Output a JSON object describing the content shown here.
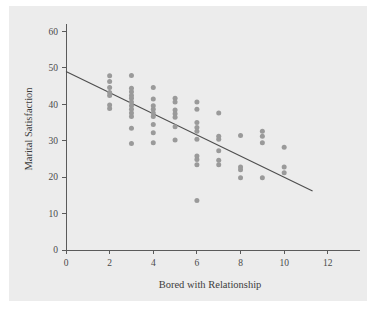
{
  "figure": {
    "background_color": "#ececec",
    "page_color": "#ffffff",
    "point_color": "#9a9a9a",
    "line_color": "#4e4e4e",
    "axis_color": "#5a5a5a"
  },
  "chart_data": {
    "type": "scatter",
    "title": "",
    "xlabel": "Bored with Relationship",
    "ylabel": "Marital Satisfaction",
    "xlim": [
      0,
      13.2
    ],
    "ylim": [
      0,
      62
    ],
    "xticks": [
      0,
      2,
      4,
      6,
      8,
      10,
      12
    ],
    "xticklabels": [
      "0",
      "2",
      "4",
      "6",
      "8",
      "10",
      "12"
    ],
    "yticks": [
      0,
      10,
      20,
      30,
      40,
      50,
      60
    ],
    "yticklabels": [
      "0",
      "10",
      "20",
      "30",
      "40",
      "50",
      "60"
    ],
    "grid": false,
    "legend": "none",
    "points": [
      {
        "x": 2,
        "y": 47.8
      },
      {
        "x": 2,
        "y": 46.2
      },
      {
        "x": 2,
        "y": 44.6
      },
      {
        "x": 2,
        "y": 43.2
      },
      {
        "x": 2,
        "y": 42.4
      },
      {
        "x": 2,
        "y": 39.8
      },
      {
        "x": 2,
        "y": 38.8
      },
      {
        "x": 3,
        "y": 47.9
      },
      {
        "x": 3,
        "y": 44.4
      },
      {
        "x": 3,
        "y": 43.4
      },
      {
        "x": 3,
        "y": 42.4
      },
      {
        "x": 3,
        "y": 41.6
      },
      {
        "x": 3,
        "y": 40.6
      },
      {
        "x": 3,
        "y": 39.6
      },
      {
        "x": 3,
        "y": 38.6
      },
      {
        "x": 3,
        "y": 37.6
      },
      {
        "x": 3,
        "y": 36.6
      },
      {
        "x": 3,
        "y": 33.4
      },
      {
        "x": 3,
        "y": 29.2
      },
      {
        "x": 4,
        "y": 44.6
      },
      {
        "x": 4,
        "y": 41.4
      },
      {
        "x": 4,
        "y": 39.6
      },
      {
        "x": 4,
        "y": 38.6
      },
      {
        "x": 4,
        "y": 37.6
      },
      {
        "x": 4,
        "y": 36.6
      },
      {
        "x": 4,
        "y": 34.4
      },
      {
        "x": 4,
        "y": 32.2
      },
      {
        "x": 4,
        "y": 29.4
      },
      {
        "x": 5,
        "y": 41.6
      },
      {
        "x": 5,
        "y": 40.6
      },
      {
        "x": 5,
        "y": 38.4
      },
      {
        "x": 5,
        "y": 37.4
      },
      {
        "x": 5,
        "y": 36.4
      },
      {
        "x": 5,
        "y": 33.8
      },
      {
        "x": 5,
        "y": 30.2
      },
      {
        "x": 6,
        "y": 40.6
      },
      {
        "x": 6,
        "y": 38.6
      },
      {
        "x": 6,
        "y": 35.0
      },
      {
        "x": 6,
        "y": 33.6
      },
      {
        "x": 6,
        "y": 32.6
      },
      {
        "x": 6,
        "y": 30.4
      },
      {
        "x": 6,
        "y": 25.8
      },
      {
        "x": 6,
        "y": 24.8
      },
      {
        "x": 6,
        "y": 23.4
      },
      {
        "x": 6,
        "y": 13.6
      },
      {
        "x": 7,
        "y": 37.6
      },
      {
        "x": 7,
        "y": 31.2
      },
      {
        "x": 7,
        "y": 30.4
      },
      {
        "x": 7,
        "y": 27.2
      },
      {
        "x": 7,
        "y": 24.6
      },
      {
        "x": 7,
        "y": 23.4
      },
      {
        "x": 8,
        "y": 31.4
      },
      {
        "x": 8,
        "y": 22.8
      },
      {
        "x": 8,
        "y": 22.0
      },
      {
        "x": 8,
        "y": 19.8
      },
      {
        "x": 9,
        "y": 32.6
      },
      {
        "x": 9,
        "y": 31.2
      },
      {
        "x": 9,
        "y": 29.4
      },
      {
        "x": 9,
        "y": 19.8
      },
      {
        "x": 10,
        "y": 28.2
      },
      {
        "x": 10,
        "y": 22.8
      },
      {
        "x": 10,
        "y": 21.2
      }
    ],
    "fit_line": {
      "name": "regression line",
      "x_start": 0,
      "y_start": 49.0,
      "x_end": 11.3,
      "y_end": 16.2
    }
  }
}
